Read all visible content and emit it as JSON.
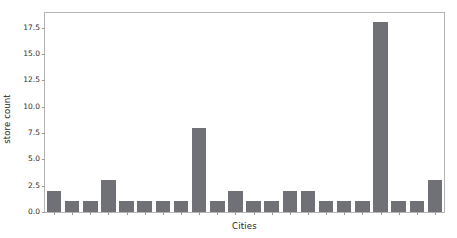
{
  "chart_data": {
    "type": "bar",
    "title": "",
    "subtitle": "",
    "xlabel": "Cities",
    "ylabel": "store count",
    "categories": [
      "1",
      "2",
      "3",
      "4",
      "5",
      "6",
      "7",
      "8",
      "9",
      "10",
      "11",
      "12",
      "13",
      "14",
      "15",
      "16",
      "17",
      "18",
      "19",
      "20",
      "21",
      "22"
    ],
    "values": [
      2,
      1,
      1,
      3,
      1,
      1,
      1,
      1,
      8,
      1,
      2,
      1,
      1,
      2,
      2,
      1,
      1,
      1,
      18,
      1,
      1,
      3
    ],
    "ylim": [
      0,
      18.9
    ],
    "xlim": [
      0,
      22
    ],
    "yticks": [
      0.0,
      2.5,
      5.0,
      7.5,
      10.0,
      12.5,
      15.0,
      17.5
    ],
    "ytick_labels": [
      "0.0",
      "2.5",
      "5.0",
      "7.5",
      "10.0",
      "12.5",
      "15.0",
      "17.5"
    ],
    "xtick_labels": [
      "",
      "",
      "",
      "",
      "",
      "",
      "",
      "",
      "",
      "",
      "",
      "",
      "",
      "",
      "",
      "",
      "",
      "",
      "",
      "",
      "",
      ""
    ],
    "grid": false,
    "legend": null,
    "legend_position": "none",
    "bar_color": "#6f7177",
    "bar_width_fraction": 0.8,
    "axis_color": "#b5b5b5",
    "text_color": "#262626",
    "background": "#ffffff"
  }
}
